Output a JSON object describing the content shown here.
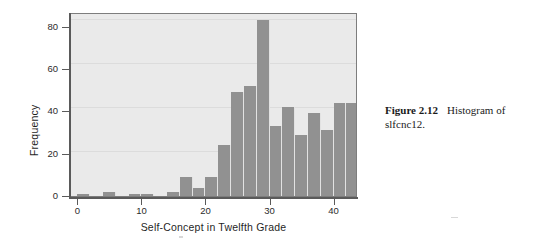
{
  "figure": {
    "caption_label": "Figure 2.12",
    "caption_text": "Histogram of slfcnc12."
  },
  "colors": {
    "bar_fill": "#919191",
    "plot_background": "#eaeaea",
    "axis": "#5a5a5a",
    "gridline": "#dcdcdc",
    "text": "#1f1f1f"
  },
  "chart_data": {
    "type": "bar",
    "title": "",
    "subtitle": "",
    "xlabel": "Self-Concept in Twelfth Grade",
    "ylabel": "Frequency",
    "xlim": [
      -1,
      43.5
    ],
    "ylim": [
      0,
      86
    ],
    "xticks": [
      0,
      10,
      20,
      30,
      40
    ],
    "xtick_labels": [
      "0",
      "10",
      "20",
      "30",
      "40"
    ],
    "yticks": [
      0,
      20,
      40,
      60,
      80
    ],
    "ytick_labels": [
      "0",
      "20",
      "40",
      "60",
      "80"
    ],
    "grid": true,
    "legend": null,
    "bin_width": 2,
    "bin_starts": [
      0,
      2,
      4,
      6,
      8,
      10,
      12,
      14,
      16,
      18,
      20,
      22,
      24,
      26,
      28,
      30,
      32,
      34,
      36,
      38,
      40,
      42
    ],
    "categories": [
      "0-2",
      "2-4",
      "4-6",
      "6-8",
      "8-10",
      "10-12",
      "12-14",
      "14-16",
      "16-18",
      "18-20",
      "20-22",
      "22-24",
      "24-26",
      "26-28",
      "28-30",
      "30-32",
      "32-34",
      "34-36",
      "36-38",
      "38-40",
      "40-42",
      "42-44"
    ],
    "values": [
      1,
      0,
      2,
      0,
      1,
      1,
      0,
      2,
      9,
      4,
      9,
      24,
      49,
      52,
      83,
      33,
      42,
      29,
      39,
      31,
      44,
      44
    ]
  }
}
